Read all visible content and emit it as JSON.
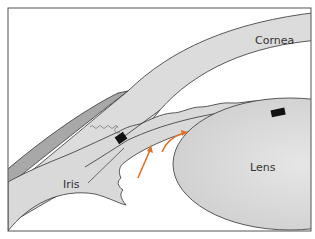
{
  "figure": {
    "type": "anatomical-diagram",
    "labels": {
      "cornea": "Cornea",
      "iris": "Iris",
      "lens": "Lens"
    },
    "colors": {
      "frame": "#555555",
      "tissue_fill": "#d9d9d9",
      "sclera_band": "#a8a8a8",
      "outline": "#333333",
      "marker_block": "#111111",
      "flow_arrows": "#e0702a",
      "background": "#ffffff"
    },
    "arrows": {
      "count": 2,
      "meaning": "aqueous flow direction"
    },
    "markers": {
      "count": 2,
      "shape": "black rectangles"
    }
  }
}
